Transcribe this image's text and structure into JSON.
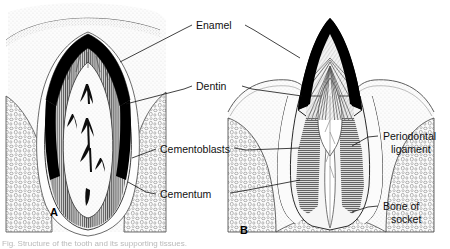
{
  "figure": {
    "background_color": "#ffffff",
    "ink_color": "#111111",
    "enamel_fill": "#000000",
    "dentin_fill": "#6e6e6e",
    "bone_fill": "#f2f2f2",
    "pulp_fill": "#ffffff"
  },
  "labels": {
    "enamel": "Enamel",
    "dentin": "Dentin",
    "cementoblasts": "Cementoblasts",
    "cementum": "Cementum",
    "periodontal_line1": "Periodontal",
    "periodontal_line2": "ligament",
    "bone_line1": "Bone of",
    "bone_line2": "socket"
  },
  "panels": {
    "a": "A",
    "b": "B"
  },
  "caption": {
    "cut_off_text": "Fig. Structure of the tooth and its supporting tissues."
  }
}
